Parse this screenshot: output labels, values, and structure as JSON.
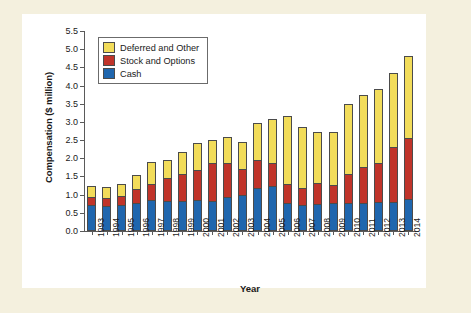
{
  "figure": {
    "background_color": "#f4f0de",
    "plot_background_color": "#ffffff"
  },
  "chart_data": {
    "type": "bar",
    "stacked": true,
    "title": "",
    "xlabel": "Year",
    "ylabel": "Compensation ($ million)",
    "ylim": [
      0.0,
      5.5
    ],
    "ytick_labels": [
      "0.0",
      "0.5",
      "1.0",
      "1.5",
      "2.0",
      "2.5",
      "3.0",
      "3.5",
      "4.0",
      "4.5",
      "5.0",
      "5.5"
    ],
    "ytick_values": [
      0.0,
      0.5,
      1.0,
      1.5,
      2.0,
      2.5,
      3.0,
      3.5,
      4.0,
      4.5,
      5.0,
      5.5
    ],
    "grid": false,
    "legend_position": "upper-left",
    "categories": [
      "1993",
      "1994",
      "1995",
      "1996",
      "1997",
      "1998",
      "1999",
      "2000",
      "2001",
      "2002",
      "2003",
      "2004",
      "2005",
      "2006",
      "2007",
      "2008",
      "2009",
      "2010",
      "2011",
      "2012",
      "2013",
      "2014"
    ],
    "series": [
      {
        "name": "Cash",
        "color": "#1f66ae",
        "values": [
          0.72,
          0.7,
          0.72,
          0.78,
          0.85,
          0.83,
          0.82,
          0.86,
          0.82,
          0.93,
          1.0,
          1.17,
          1.24,
          0.78,
          0.72,
          0.75,
          0.76,
          0.77,
          0.78,
          0.79,
          0.8,
          0.87
        ]
      },
      {
        "name": "Stock and Options",
        "color": "#c0342a",
        "values": [
          0.22,
          0.22,
          0.25,
          0.38,
          0.45,
          0.62,
          0.76,
          0.81,
          1.05,
          0.95,
          0.71,
          0.77,
          0.62,
          0.5,
          0.45,
          0.56,
          0.51,
          0.79,
          0.97,
          1.08,
          1.5,
          1.7
        ]
      },
      {
        "name": "Deferred and Other",
        "color": "#f2dc5a",
        "values": [
          0.31,
          0.3,
          0.32,
          0.39,
          0.6,
          0.5,
          0.59,
          0.75,
          0.63,
          0.7,
          0.74,
          1.02,
          1.22,
          1.87,
          1.7,
          1.42,
          1.46,
          1.94,
          2.0,
          2.03,
          2.05,
          2.25
        ]
      }
    ],
    "totals": [
      1.25,
      1.22,
      1.29,
      1.55,
      1.9,
      1.95,
      2.17,
      2.42,
      2.5,
      2.58,
      2.45,
      2.96,
      3.08,
      3.15,
      2.87,
      2.73,
      2.73,
      3.5,
      3.75,
      3.9,
      4.35,
      4.82
    ]
  },
  "legend": {
    "items": [
      {
        "label": "Deferred and Other",
        "color": "#f2dc5a"
      },
      {
        "label": "Stock and Options",
        "color": "#c0342a"
      },
      {
        "label": "Cash",
        "color": "#1f66ae"
      }
    ]
  }
}
